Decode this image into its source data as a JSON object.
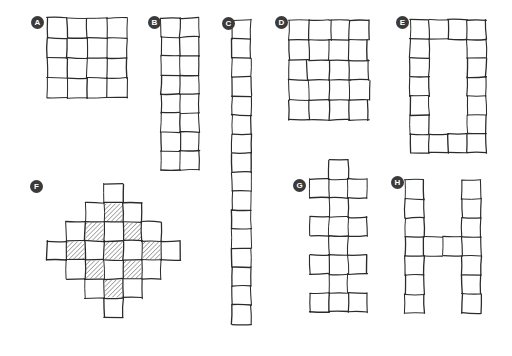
{
  "page": {
    "background_color": "#ffffff",
    "ink_color": "#2b2b2b",
    "badge_fill": "#3a3a3a",
    "badge_text_color": "#ffffff",
    "width": 512,
    "height": 356
  },
  "figures": [
    {
      "id": "A",
      "label": "A",
      "name": "4x4-square-grid",
      "shape": "rectangle",
      "cols": 4,
      "rows": 4,
      "cell_count": 16,
      "hatched": false,
      "badge": {
        "x": 31,
        "y": 16
      },
      "origin": {
        "x": 47,
        "y": 18
      },
      "cell": 20
    },
    {
      "id": "B",
      "label": "B",
      "name": "2x8-column-grid",
      "shape": "rectangle",
      "cols": 2,
      "rows": 8,
      "cell_count": 16,
      "hatched": false,
      "badge": {
        "x": 148,
        "y": 16
      },
      "origin": {
        "x": 161,
        "y": 18
      },
      "cell": 19
    },
    {
      "id": "C",
      "label": "C",
      "name": "1x16-single-column-grid",
      "shape": "rectangle",
      "cols": 1,
      "rows": 16,
      "cell_count": 16,
      "hatched": false,
      "badge": {
        "x": 222,
        "y": 17
      },
      "origin": {
        "x": 232,
        "y": 20
      },
      "cell": 19
    },
    {
      "id": "D",
      "label": "D",
      "name": "4x5-brick-offset-grid",
      "shape": "rectangle-brick",
      "cols": 4,
      "rows": 5,
      "cell_count": 20,
      "hatched": false,
      "badge": {
        "x": 275,
        "y": 16
      },
      "origin": {
        "x": 289,
        "y": 20
      },
      "cell": 20
    },
    {
      "id": "E",
      "label": "E",
      "name": "hollow-rectangle-ring-grid",
      "shape": "ring",
      "cols": 4,
      "rows": 7,
      "cell_count": 18,
      "hatched": false,
      "badge": {
        "x": 396,
        "y": 16
      },
      "origin": {
        "x": 410,
        "y": 20
      },
      "cell": 19
    },
    {
      "id": "F",
      "label": "F",
      "name": "aztec-diamond-checkerboard",
      "shape": "diamond-checkerboard",
      "cols": 7,
      "rows": 7,
      "cell_count": 25,
      "hatched": true,
      "badge": {
        "x": 30,
        "y": 180
      },
      "origin": {
        "x": 47,
        "y": 184
      },
      "cell": 19
    },
    {
      "id": "G",
      "label": "G",
      "name": "spine-with-crossbars-grid",
      "shape": "comb",
      "cols": 3,
      "rows": 8,
      "cell_count": 16,
      "hatched": false,
      "badge": {
        "x": 293,
        "y": 179
      },
      "origin": {
        "x": 310,
        "y": 160
      },
      "cell": 19
    },
    {
      "id": "H",
      "label": "H",
      "name": "letter-h-grid",
      "shape": "letter-h",
      "cols": 4,
      "rows": 7,
      "cell_count": 16,
      "hatched": false,
      "badge": {
        "x": 391,
        "y": 176
      },
      "origin": {
        "x": 405,
        "y": 180
      },
      "cell": 19
    }
  ]
}
